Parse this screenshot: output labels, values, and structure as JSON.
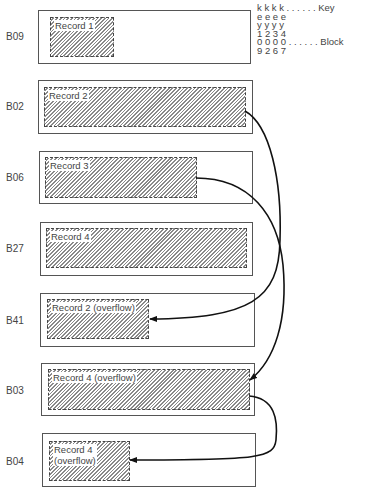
{
  "blocks": [
    {
      "id": "B09",
      "label": "B09",
      "record": "Record 1"
    },
    {
      "id": "B02",
      "label": "B02",
      "record": "Record 2"
    },
    {
      "id": "B06",
      "label": "B06",
      "record": "Record 3"
    },
    {
      "id": "B27",
      "label": "B27",
      "record": "Record 4"
    },
    {
      "id": "B41",
      "label": "B41",
      "record": "Record 2 (overflow)"
    },
    {
      "id": "B03",
      "label": "B03",
      "record": "Record 4 (overflow)"
    },
    {
      "id": "B04",
      "label": "B04",
      "record_line1": "Record 4",
      "record_line2": "(overflow)"
    }
  ],
  "legend": {
    "row1": "k k k k . . . . . . Key",
    "row2": "e e e e",
    "row3": "y y y y",
    "row4": "1 2 3 4",
    "row5": "0 0 0 0 . . . . . . Block",
    "row6": "9 2 6 7"
  },
  "links": [
    {
      "from": "B02",
      "to": "B41"
    },
    {
      "from": "B06",
      "to": "B03"
    },
    {
      "from": "B03",
      "to": "B04"
    }
  ]
}
